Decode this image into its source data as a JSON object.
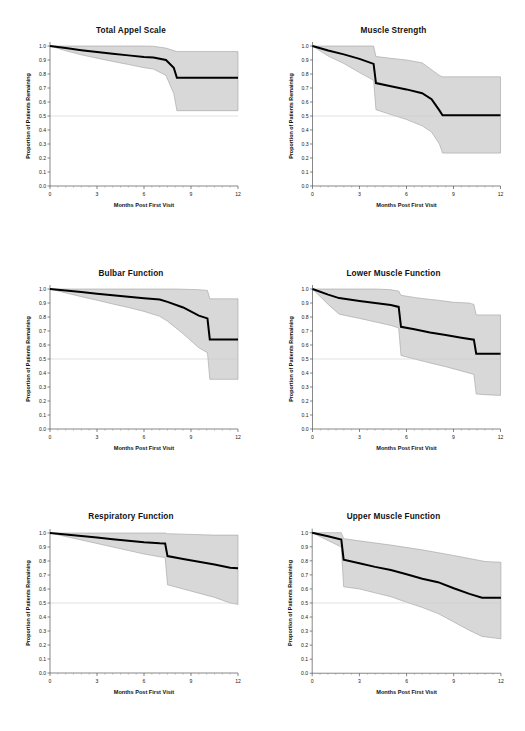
{
  "figure": {
    "background": "#ffffff",
    "band_color": "#d8d8d8",
    "band_edge_color": "#9a9a9a",
    "curve_color": "#000000",
    "reference_line_color": "#cfcfcf"
  },
  "axes": {
    "xlabel": "Months Post First Visit",
    "ylabel": "Proportion of Patients Remaining",
    "xticks": [
      "0",
      "3",
      "6",
      "9",
      "12"
    ],
    "xtick_values": [
      0,
      3,
      6,
      9,
      12
    ],
    "xlim": [
      0,
      12
    ],
    "yticks": [
      "0.0",
      "0.1",
      "0.2",
      "0.3",
      "0.4",
      "0.5",
      "0.6",
      "0.7",
      "0.8",
      "0.9",
      "1.0"
    ],
    "ytick_values": [
      0.0,
      0.1,
      0.2,
      0.3,
      0.4,
      0.5,
      0.6,
      0.7,
      0.8,
      0.9,
      1.0
    ],
    "ylim": [
      0,
      1.0
    ],
    "reference_line_y": 0.5,
    "grid": false
  },
  "chart_data": [
    {
      "type": "line",
      "title": "Total Appel Scale",
      "xlabel": "Months Post First Visit",
      "ylabel": "Proportion of Patients Remaining",
      "xlim": [
        0,
        12
      ],
      "ylim": [
        0,
        1.0
      ],
      "grid": false,
      "series": [
        {
          "name": "Survival estimate",
          "x": [
            0,
            1,
            2,
            3,
            4,
            5,
            6,
            6.6,
            7.4,
            7.9,
            8.1,
            9,
            10,
            11,
            12
          ],
          "values": [
            1.0,
            0.985,
            0.97,
            0.957,
            0.945,
            0.933,
            0.922,
            0.918,
            0.9,
            0.845,
            0.773,
            0.773,
            0.773,
            0.773,
            0.773
          ]
        },
        {
          "name": "Upper 95% CI",
          "x": [
            0,
            2,
            4,
            6,
            6.6,
            7.4,
            8.1,
            9,
            12
          ],
          "values": [
            1.0,
            1.0,
            1.0,
            1.0,
            0.998,
            0.985,
            0.96,
            0.96,
            0.96
          ]
        },
        {
          "name": "Lower 95% CI",
          "x": [
            0,
            1,
            2,
            3,
            4,
            5,
            6,
            6.6,
            7.4,
            7.9,
            8.1,
            9,
            12
          ],
          "values": [
            1.0,
            0.966,
            0.937,
            0.913,
            0.89,
            0.868,
            0.845,
            0.835,
            0.79,
            0.66,
            0.538,
            0.538,
            0.538
          ]
        }
      ]
    },
    {
      "type": "line",
      "title": "Muscle Strength",
      "xlabel": "Months Post First Visit",
      "ylabel": "Proportion of Patients Remaining",
      "xlim": [
        0,
        12
      ],
      "ylim": [
        0,
        1.0
      ],
      "grid": false,
      "series": [
        {
          "name": "Survival estimate",
          "x": [
            0,
            1,
            2,
            3,
            3.9,
            4.05,
            5,
            6,
            7,
            7.6,
            8.1,
            8.3,
            9,
            10,
            11,
            12
          ],
          "values": [
            1.0,
            0.968,
            0.94,
            0.908,
            0.872,
            0.735,
            0.712,
            0.69,
            0.663,
            0.62,
            0.54,
            0.505,
            0.505,
            0.505,
            0.505,
            0.505
          ]
        },
        {
          "name": "Upper 95% CI",
          "x": [
            0,
            1,
            2,
            3,
            3.9,
            4.05,
            5,
            6,
            7,
            8.1,
            8.3,
            9,
            12
          ],
          "values": [
            1.0,
            1.0,
            1.0,
            1.0,
            1.0,
            0.925,
            0.912,
            0.9,
            0.88,
            0.79,
            0.78,
            0.78,
            0.78
          ]
        },
        {
          "name": "Lower 95% CI",
          "x": [
            0,
            1,
            2,
            3,
            3.9,
            4.05,
            5,
            6,
            7,
            7.6,
            8.1,
            8.3,
            9,
            12
          ],
          "values": [
            1.0,
            0.928,
            0.875,
            0.81,
            0.755,
            0.545,
            0.51,
            0.475,
            0.43,
            0.385,
            0.3,
            0.235,
            0.235,
            0.235
          ]
        }
      ]
    },
    {
      "type": "line",
      "title": "Bulbar Function",
      "xlabel": "Months Post First Visit",
      "ylabel": "Proportion of Patients Remaining",
      "xlim": [
        0,
        12
      ],
      "ylim": [
        0,
        1.0
      ],
      "grid": false,
      "series": [
        {
          "name": "Survival estimate",
          "x": [
            0,
            1,
            2,
            3,
            4,
            5,
            6,
            7,
            7.5,
            8.5,
            9.5,
            10.05,
            10.2,
            11,
            12
          ],
          "values": [
            1.0,
            0.99,
            0.978,
            0.966,
            0.955,
            0.944,
            0.934,
            0.925,
            0.908,
            0.868,
            0.81,
            0.79,
            0.64,
            0.64,
            0.64
          ]
        },
        {
          "name": "Upper 95% CI",
          "x": [
            0,
            2,
            4,
            6,
            8,
            9.5,
            10.05,
            10.2,
            12
          ],
          "values": [
            1.0,
            1.0,
            1.0,
            1.0,
            1.0,
            0.995,
            0.99,
            0.93,
            0.93
          ]
        },
        {
          "name": "Lower 95% CI",
          "x": [
            0,
            1,
            2,
            3,
            4,
            5,
            6,
            7,
            7.5,
            8.5,
            9.5,
            10.05,
            10.2,
            12
          ],
          "values": [
            1.0,
            0.972,
            0.945,
            0.92,
            0.893,
            0.868,
            0.84,
            0.805,
            0.77,
            0.68,
            0.58,
            0.545,
            0.355,
            0.355
          ]
        }
      ]
    },
    {
      "type": "line",
      "title": "Lower Muscle Function",
      "xlabel": "Months Post First Visit",
      "ylabel": "Proportion of Patients Remaining",
      "xlim": [
        0,
        12
      ],
      "ylim": [
        0,
        1.0
      ],
      "grid": false,
      "series": [
        {
          "name": "Survival estimate",
          "x": [
            0,
            1,
            1.7,
            3,
            4,
            5,
            5.5,
            5.65,
            6.5,
            7.5,
            8.5,
            9.5,
            10.3,
            10.45,
            11,
            12
          ],
          "values": [
            1.0,
            0.96,
            0.935,
            0.915,
            0.9,
            0.885,
            0.872,
            0.73,
            0.712,
            0.69,
            0.672,
            0.652,
            0.638,
            0.538,
            0.538,
            0.538
          ]
        },
        {
          "name": "Upper 95% CI",
          "x": [
            0,
            1,
            1.7,
            3,
            4,
            5,
            5.5,
            5.65,
            6.5,
            7,
            8,
            9,
            10,
            10.3,
            10.45,
            12
          ],
          "values": [
            1.0,
            1.02,
            1.035,
            1.025,
            1.01,
            0.995,
            0.985,
            0.955,
            0.94,
            0.932,
            0.92,
            0.905,
            0.9,
            0.89,
            0.815,
            0.815
          ]
        },
        {
          "name": "Lower 95% CI",
          "x": [
            0,
            1,
            1.7,
            3,
            4,
            5,
            5.5,
            5.65,
            6.5,
            7.5,
            8.5,
            9.5,
            10.3,
            10.45,
            11,
            12
          ],
          "values": [
            1.0,
            0.89,
            0.82,
            0.79,
            0.765,
            0.74,
            0.722,
            0.525,
            0.5,
            0.472,
            0.445,
            0.415,
            0.39,
            0.25,
            0.245,
            0.24
          ]
        }
      ]
    },
    {
      "type": "line",
      "title": "Respiratory Function",
      "xlabel": "Months Post First Visit",
      "ylabel": "Proportion of Patients Remaining",
      "xlim": [
        0,
        12
      ],
      "ylim": [
        0,
        1.0
      ],
      "grid": false,
      "series": [
        {
          "name": "Survival estimate",
          "x": [
            0,
            1,
            2,
            3,
            4,
            5,
            6,
            7,
            7.35,
            7.5,
            8.5,
            9.5,
            10.5,
            11.5,
            12
          ],
          "values": [
            1.0,
            0.99,
            0.978,
            0.967,
            0.956,
            0.945,
            0.934,
            0.926,
            0.925,
            0.835,
            0.815,
            0.795,
            0.775,
            0.752,
            0.748
          ]
        },
        {
          "name": "Upper 95% CI",
          "x": [
            0,
            2,
            4,
            6,
            7.35,
            7.5,
            9,
            10.5,
            12
          ],
          "values": [
            1.0,
            1.0,
            1.0,
            1.0,
            1.02,
            0.995,
            0.99,
            0.985,
            0.985
          ]
        },
        {
          "name": "Lower 95% CI",
          "x": [
            0,
            1,
            2,
            3,
            4,
            5,
            6,
            7,
            7.35,
            7.5,
            8.5,
            9.5,
            10.5,
            11.5,
            12
          ],
          "values": [
            1.0,
            0.975,
            0.95,
            0.925,
            0.9,
            0.875,
            0.85,
            0.83,
            0.825,
            0.63,
            0.6,
            0.57,
            0.54,
            0.5,
            0.49
          ]
        }
      ]
    },
    {
      "type": "line",
      "title": "Upper Muscle Function",
      "xlabel": "Months Post First Visit",
      "ylabel": "Proportion of Patients Remaining",
      "xlim": [
        0,
        12
      ],
      "ylim": [
        0,
        1.0
      ],
      "grid": false,
      "series": [
        {
          "name": "Survival estimate",
          "x": [
            0,
            1,
            1.85,
            2.0,
            3,
            4,
            5,
            6,
            7,
            8,
            9,
            10,
            10.8,
            11,
            12
          ],
          "values": [
            1.0,
            0.975,
            0.952,
            0.808,
            0.782,
            0.757,
            0.735,
            0.705,
            0.672,
            0.648,
            0.605,
            0.565,
            0.538,
            0.538,
            0.538
          ]
        },
        {
          "name": "Upper 95% CI",
          "x": [
            0,
            1,
            1.85,
            2.0,
            3,
            5,
            7,
            9,
            11,
            12
          ],
          "values": [
            1.0,
            1.005,
            1.01,
            0.958,
            0.942,
            0.912,
            0.878,
            0.838,
            0.795,
            0.79
          ]
        },
        {
          "name": "Lower 95% CI",
          "x": [
            0,
            1,
            1.85,
            2.0,
            3,
            4,
            5,
            6,
            7,
            8,
            9,
            10,
            10.8,
            12
          ],
          "values": [
            1.0,
            0.945,
            0.898,
            0.615,
            0.6,
            0.572,
            0.545,
            0.505,
            0.468,
            0.425,
            0.365,
            0.305,
            0.262,
            0.245
          ]
        }
      ]
    }
  ]
}
